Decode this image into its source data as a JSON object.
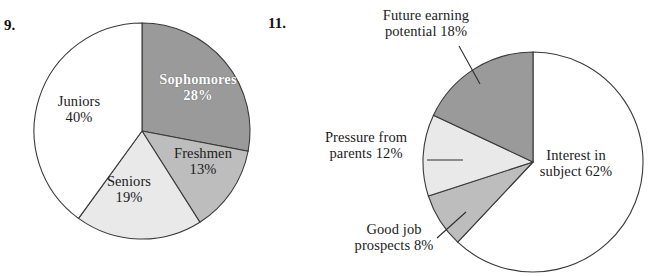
{
  "page": {
    "width": 648,
    "height": 276,
    "background": "#ffffff"
  },
  "colors": {
    "white_slice": "#ffffff",
    "light_gray_slice": "#e9e9e9",
    "medium_gray_slice": "#bdbdbd",
    "dark_gray_slice": "#9a9a9a",
    "outline": "#3a3a3a",
    "text": "#1b1b1b",
    "label_on_dark": "#ffffff"
  },
  "figures": [
    {
      "number": "9.",
      "center": {
        "x": 142,
        "y": 131
      },
      "radius": 108,
      "chart_data": {
        "type": "pie",
        "title": "",
        "start_angle_deg": 0,
        "direction": "clockwise",
        "units": "percent",
        "total": 100,
        "labels_inside": true,
        "categories": [
          "Sophomores",
          "Freshmen",
          "Seniors",
          "Juniors"
        ],
        "values": [
          28,
          13,
          19,
          40
        ],
        "slices": [
          {
            "name": "Sophomores",
            "value": 28,
            "label_line1": "Sophomores",
            "label_line2": "28%",
            "color": "#9a9a9a",
            "text_color": "#ffffff",
            "bold": true,
            "label_x": 148,
            "label_y": 72,
            "label_w": 100
          },
          {
            "name": "Freshmen",
            "value": 13,
            "label_line1": "Freshmen",
            "label_line2": "13%",
            "color": "#bdbdbd",
            "text_color": "#1b1b1b",
            "bold": false,
            "label_x": 162,
            "label_y": 146,
            "label_w": 82
          },
          {
            "name": "Seniors",
            "value": 19,
            "label_line1": "Seniors",
            "label_line2": "19%",
            "color": "#e9e9e9",
            "text_color": "#1b1b1b",
            "bold": false,
            "label_x": 93,
            "label_y": 174,
            "label_w": 72
          },
          {
            "name": "Juniors",
            "value": 40,
            "label_line1": "Juniors",
            "label_line2": "40%",
            "color": "#ffffff",
            "text_color": "#1b1b1b",
            "bold": false,
            "label_x": 43,
            "label_y": 94,
            "label_w": 72
          }
        ]
      }
    },
    {
      "number": "11.",
      "center": {
        "x": 533,
        "y": 162
      },
      "radius": 110,
      "chart_data": {
        "type": "pie",
        "title": "",
        "start_angle_deg": 0,
        "direction": "clockwise",
        "units": "percent",
        "total": 100,
        "labels_inside": false,
        "categories": [
          "Interest in subject",
          "Good job prospects",
          "Pressure from parents",
          "Future earning potential"
        ],
        "values": [
          62,
          8,
          12,
          18
        ],
        "slices": [
          {
            "name": "Interest in subject",
            "value": 62,
            "label_line1": "Interest in",
            "label_line2": "subject 62%",
            "color": "#ffffff",
            "text_color": "#1b1b1b",
            "inside": true,
            "label_x": 516,
            "label_y": 148,
            "label_w": 120,
            "leader": null
          },
          {
            "name": "Good job prospects",
            "value": 8,
            "label_line1": "Good job",
            "label_line2": "prospects 8%",
            "color": "#bdbdbd",
            "text_color": "#1b1b1b",
            "inside": false,
            "label_x": 332,
            "label_y": 222,
            "label_w": 124,
            "leader": {
              "x1": 437,
              "y1": 238,
              "x2": 466,
              "y2": 212
            }
          },
          {
            "name": "Pressure from parents",
            "value": 12,
            "label_line1": "Pressure from",
            "label_line2": "parents 12%",
            "color": "#e9e9e9",
            "text_color": "#1b1b1b",
            "inside": false,
            "label_x": 303,
            "label_y": 130,
            "label_w": 126,
            "leader": {
              "x1": 427,
              "y1": 160,
              "x2": 463,
              "y2": 160
            }
          },
          {
            "name": "Future earning potential",
            "value": 18,
            "label_line1": "Future earning",
            "label_line2": "potential 18%",
            "color": "#9a9a9a",
            "text_color": "#1b1b1b",
            "inside": false,
            "label_x": 361,
            "label_y": 8,
            "label_w": 130,
            "leader": {
              "x1": 459,
              "y1": 46,
              "x2": 480,
              "y2": 84
            }
          }
        ]
      }
    }
  ]
}
